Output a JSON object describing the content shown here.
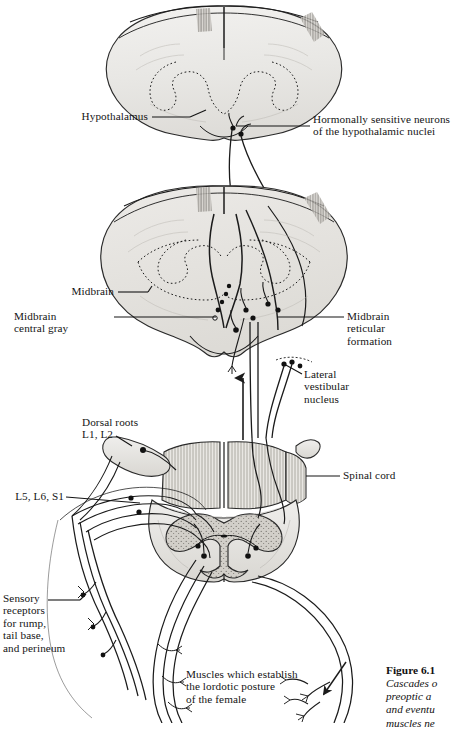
{
  "figure": {
    "domain_note": "Anatomical neuroscience textbook illustration",
    "background_color": "#ffffff",
    "ink_color": "#1b1b1b"
  },
  "labels": [
    {
      "id": "hypothalamus",
      "text": "Hypothalamus",
      "side": "left"
    },
    {
      "id": "hormonal-neurons",
      "text": "Hormonally sensitive neurons\nof the hypothalamic nuclei",
      "side": "right"
    },
    {
      "id": "midbrain",
      "text": "Midbrain",
      "side": "left"
    },
    {
      "id": "midbrain-central-gray",
      "text": "Midbrain\ncentral gray",
      "side": "left"
    },
    {
      "id": "midbrain-reticular",
      "text": "Midbrain\nreticular\nformation",
      "side": "right"
    },
    {
      "id": "lateral-vestibular",
      "text": "Lateral\nvestibular\nnucleus",
      "side": "right"
    },
    {
      "id": "dorsal-roots",
      "text": "Dorsal roots\nL1, L2",
      "side": "left"
    },
    {
      "id": "lumbosacral-roots",
      "text": "L5, L6, S1",
      "side": "left"
    },
    {
      "id": "spinal-cord",
      "text": "Spinal cord",
      "side": "right"
    },
    {
      "id": "sensory-receptors",
      "text": "Sensory\nreceptors\nfor rump,\ntail base,\nand perineum",
      "side": "left"
    },
    {
      "id": "lordosis-muscles",
      "text": "Muscles which establish\nthe lordotic posture\nof the female",
      "side": "center"
    }
  ],
  "caption": {
    "number": "Figure 6.1",
    "line1": "Cascades o",
    "line2": "preoptic a",
    "line3": "and eventu",
    "line4": "muscles ne"
  },
  "sections": {
    "top": "coronal section through the hypothalamus",
    "middle": "coronal section through the midbrain",
    "bottom": "cross section of the lumbar spinal cord"
  }
}
